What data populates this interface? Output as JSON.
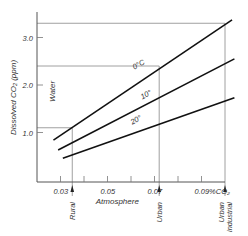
{
  "chart_data": {
    "type": "line",
    "title": "",
    "xlabel": "Atmosphere",
    "ylabel": "Dissolved CO2 (ppm)",
    "ylabel_text": "Dissolved CO₂ (ppm)",
    "y_side_label": "Water",
    "xlim": [
      0.02,
      0.1
    ],
    "ylim": [
      0,
      3.4
    ],
    "x_ticks": [
      0.03,
      0.04,
      0.05,
      0.06,
      0.07,
      0.08,
      0.09
    ],
    "x_tick_labels": [
      {
        "value": 0.03,
        "label": "0.03"
      },
      {
        "value": 0.05,
        "label": "0.05"
      },
      {
        "value": 0.07,
        "label": "0.07"
      },
      {
        "value": 0.09,
        "label": "0.09%CO₂"
      }
    ],
    "y_ticks": [
      {
        "value": 1.0,
        "label": "1.0"
      },
      {
        "value": 2.0,
        "label": "2.0"
      },
      {
        "value": 3.0,
        "label": "3.0"
      }
    ],
    "series": [
      {
        "name": "0°C",
        "label": "0°C",
        "x": [
          0.027,
          0.103
        ],
        "y": [
          0.84,
          3.37
        ]
      },
      {
        "name": "10°",
        "label": "10°",
        "x": [
          0.029,
          0.104
        ],
        "y": [
          0.63,
          2.55
        ]
      },
      {
        "name": "20°",
        "label": "20°",
        "x": [
          0.031,
          0.104
        ],
        "y": [
          0.46,
          1.73
        ]
      }
    ],
    "markers": [
      {
        "label": "Rural",
        "x": 0.035,
        "y_level": 1.1
      },
      {
        "label": "Urban",
        "x": 0.072,
        "y_level": 2.4
      },
      {
        "label": "Urban industrial",
        "label_lines": [
          "Urban",
          "industrial"
        ],
        "x": 0.1,
        "y_level": 3.3
      }
    ],
    "grid": false,
    "legend": "inline labels on lines"
  }
}
